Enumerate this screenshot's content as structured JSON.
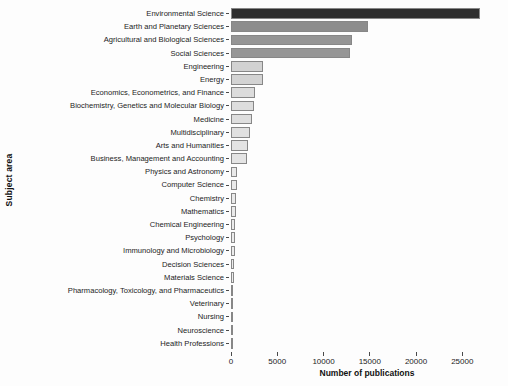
{
  "figure": {
    "background_color": "#fdfdfd",
    "text_color": "#1c1c1c"
  },
  "chart_data": {
    "type": "bar",
    "orientation": "horizontal",
    "title": "",
    "xlabel": "Number of publications",
    "ylabel": "Subject area",
    "xlim": [
      0,
      29400
    ],
    "x_ticks": [
      0,
      5000,
      10000,
      15000,
      20000,
      25000
    ],
    "x_tick_labels": [
      "0",
      "5000",
      "10000",
      "15000",
      "20000",
      "25000"
    ],
    "grid": false,
    "legend": "none",
    "sort_order": "descending",
    "categories": [
      "Environmental Science",
      "Earth and Planetary Sciences",
      "Agricultural and Biological Sciences",
      "Social Sciences",
      "Engineering",
      "Energy",
      "Economics, Econometrics, and Finance",
      "Biochemistry, Genetics and Molecular Biology",
      "Medicine",
      "Multidisciplinary",
      "Arts and Humanities",
      "Business, Management and Accounting",
      "Physics and Astronomy",
      "Computer Science",
      "Chemistry",
      "Mathematics",
      "Chemical Engineering",
      "Psychology",
      "Immunology and Microbiology",
      "Decision Sciences",
      "Materials Science",
      "Pharmacology, Toxicology, and Pharmaceutics",
      "Veterinary",
      "Nursing",
      "Neuroscience",
      "Health Professions"
    ],
    "values": [
      26900,
      14800,
      13100,
      12900,
      3500,
      3450,
      2550,
      2500,
      2300,
      2100,
      1800,
      1700,
      700,
      600,
      520,
      500,
      470,
      440,
      400,
      350,
      290,
      160,
      120,
      90,
      70,
      50
    ],
    "bar_colors": [
      "#2e2e2e",
      "#8d8d8d",
      "#959595",
      "#969696",
      "#d2d2d2",
      "#d3d3d3",
      "#dcdcdc",
      "#dddddd",
      "#dedede",
      "#e0e0e0",
      "#e3e3e3",
      "#e4e4e4",
      "#e9e9e9",
      "#eaeaea",
      "#eaeaea",
      "#ebebeb",
      "#ebebeb",
      "#ececec",
      "#ececec",
      "#ededed",
      "#ededed",
      "#eeeeee",
      "#eeeeee",
      "#efefef",
      "#efefef",
      "#f0f0f0"
    ],
    "bar_border_color": "#878787"
  }
}
